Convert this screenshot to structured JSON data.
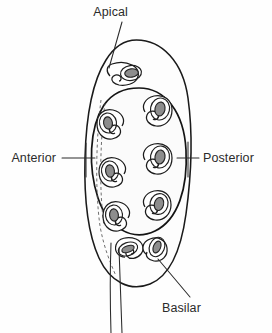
{
  "figure": {
    "background_color": "#ffffff",
    "ink_color": "#1a1a1a",
    "organelle_fill_color": "#8d8d8d",
    "labels": [
      {
        "id": "apical",
        "text": "Apical",
        "position": "top",
        "text_x": 128,
        "text_y": 16,
        "leader_from_x": 122,
        "leader_from_y": 22,
        "leader_to_x": 109,
        "leader_to_y": 68
      },
      {
        "id": "anterior",
        "text": "Anterior",
        "position": "left",
        "text_x": 44,
        "text_y": 163,
        "leader_from_x": 62,
        "leader_from_y": 158,
        "leader_to_x": 93,
        "leader_to_y": 158
      },
      {
        "id": "posterior",
        "text": "Posterior",
        "position": "right",
        "text_x": 201,
        "text_y": 163,
        "leader_from_x": 177,
        "leader_from_y": 158,
        "leader_to_x": 197,
        "leader_to_y": 158
      },
      {
        "id": "basilar",
        "text": "Basilar",
        "position": "bottom",
        "text_x": 161,
        "text_y": 312,
        "leader_from_x": 188,
        "leader_from_y": 299,
        "leader_to_x": 158,
        "leader_to_y": 259
      }
    ],
    "structures": {
      "cell_body_name": "cell-body-outline",
      "girdle_name": "equatorial-girdle",
      "apical_organelle_name": "apical-organelle",
      "flagella_count": 2,
      "ring_organelle_count": 8,
      "basal_organelle_count": 2,
      "dashed_line_name": "internal-dashed-axis"
    }
  }
}
